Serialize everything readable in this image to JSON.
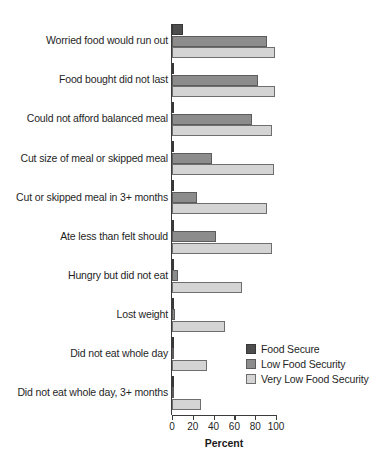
{
  "chart_data": {
    "type": "bar",
    "orientation": "horizontal",
    "title": "",
    "xlabel": "Percent",
    "ylabel": "",
    "xlim": [
      0,
      100
    ],
    "xticks": [
      "0",
      "20",
      "40",
      "60",
      "80",
      "100"
    ],
    "grid": false,
    "legend_position": "center-right",
    "categories": [
      "Worried food would run out",
      "Food bought did not last",
      "Could not afford balanced meal",
      "Cut size of meal or skipped meal",
      "Cut or skipped meal in 3+ months",
      "Ate less than felt should",
      "Hungry but did not eat",
      "Lost weight",
      "Did not eat whole day",
      "Did not eat whole day, 3+ months"
    ],
    "series": [
      {
        "name": "Food Secure",
        "color": "#4d4d4d",
        "values": [
          11,
          2,
          2,
          1,
          1,
          1,
          1,
          1,
          1,
          1
        ]
      },
      {
        "name": "Low Food Security",
        "color": "#8c8c8c",
        "values": [
          91,
          83,
          77,
          38,
          24,
          42,
          6,
          3,
          1,
          1
        ]
      },
      {
        "name": "Very Low Food Security",
        "color": "#d4d4d4",
        "values": [
          99,
          99,
          96,
          98,
          91,
          96,
          67,
          51,
          34,
          28
        ]
      }
    ]
  },
  "legend": {
    "items": [
      {
        "label": "Food Secure"
      },
      {
        "label": "Low Food Security"
      },
      {
        "label": "Very Low Food Security"
      }
    ]
  }
}
